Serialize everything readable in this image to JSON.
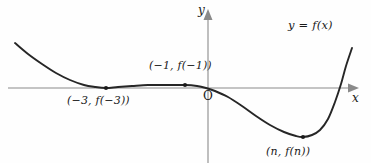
{
  "figure": {
    "background_color": "#fefefe",
    "curve_color": "#262626",
    "axis_color": "#8a8a8a",
    "label_color": "#1a1a1a"
  },
  "axes": {
    "y_label": "y",
    "x_label": "x",
    "origin_label": "O",
    "x_axis_y_px": 88,
    "y_axis_x_px": 208
  },
  "function_label": "y = f(x)",
  "points": [
    {
      "id": "local-min-left",
      "label": "(−3, f(−3))",
      "x_px": 106,
      "y_px": 88,
      "kind": "local minimum on x-axis"
    },
    {
      "id": "local-max",
      "label": "(−1, f(−1))",
      "x_px": 185,
      "y_px": 85,
      "kind": "local maximum"
    },
    {
      "id": "local-min-right",
      "label": "(n, f(n))",
      "x_px": 303,
      "y_px": 137,
      "kind": "absolute minimum"
    }
  ],
  "chart_data": {
    "type": "line",
    "title": "",
    "xlabel": "x",
    "ylabel": "y",
    "grid": false,
    "legend": "none",
    "annotations": [
      "(−3, f(−3))",
      "(−1, f(−1))",
      "(n, f(n))",
      "y = f(x)",
      "O"
    ],
    "series": [
      {
        "name": "y = f(x)",
        "points_px": [
          [
            15,
            43
          ],
          [
            28,
            54
          ],
          [
            42,
            64
          ],
          [
            56,
            73
          ],
          [
            70,
            80
          ],
          [
            84,
            85
          ],
          [
            95,
            87
          ],
          [
            106,
            88
          ],
          [
            118,
            87
          ],
          [
            132,
            86
          ],
          [
            148,
            85
          ],
          [
            165,
            85
          ],
          [
            185,
            85
          ],
          [
            197,
            86
          ],
          [
            206,
            88
          ],
          [
            215,
            91
          ],
          [
            228,
            97
          ],
          [
            242,
            106
          ],
          [
            256,
            116
          ],
          [
            270,
            125
          ],
          [
            284,
            132
          ],
          [
            296,
            136
          ],
          [
            303,
            137
          ],
          [
            312,
            135
          ],
          [
            320,
            130
          ],
          [
            328,
            119
          ],
          [
            335,
            102
          ],
          [
            341,
            84
          ],
          [
            346,
            66
          ],
          [
            352,
            48
          ]
        ]
      }
    ]
  }
}
